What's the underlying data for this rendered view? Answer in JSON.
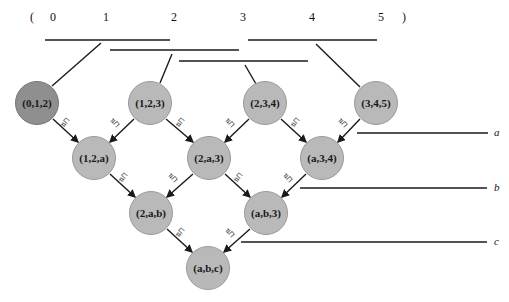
{
  "sequence": {
    "open_bracket": "(",
    "close_bracket": ")",
    "indices": [
      "0",
      "1",
      "2",
      "3",
      "4",
      "5"
    ]
  },
  "nodes": {
    "row1": [
      "(0,1,2)",
      "(1,2,3)",
      "(2,3,4)",
      "(3,4,5)"
    ],
    "row2": [
      "(1,2,a)",
      "(2,a,3)",
      "(a,3,4)"
    ],
    "row3": [
      "(2,a,b)",
      "(a,b,3)"
    ],
    "row4": [
      "(a,b,c)"
    ]
  },
  "right_labels": [
    "a",
    "b",
    "c"
  ],
  "edge_label": "⇅⊓",
  "colors": {
    "node_fill": "#b9b9b9",
    "node_fill_highlight": "#8f8f8f",
    "line": "#1a1a1a"
  }
}
